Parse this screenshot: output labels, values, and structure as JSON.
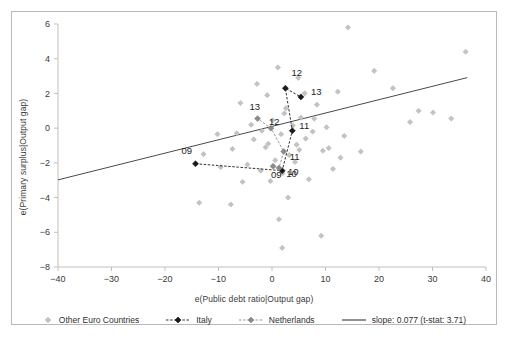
{
  "chart_data": {
    "type": "scatter",
    "title": "",
    "xlabel": "e(Public debt ratio|Output gap)",
    "ylabel": "e(Primary surplus|Output gap)",
    "xlim": [
      -40,
      40
    ],
    "ylim": [
      -8,
      6
    ],
    "xticks": [
      -40,
      -30,
      -20,
      -10,
      0,
      10,
      20,
      30,
      40
    ],
    "yticks": [
      -8,
      -6,
      -4,
      -2,
      0,
      2,
      4,
      6
    ],
    "xtick_labels": [
      "-40",
      "-30",
      "-20",
      "-10",
      "0",
      "10",
      "20",
      "30",
      "40"
    ],
    "ytick_labels": [
      "-8",
      "-6",
      "-4",
      "-2",
      "0",
      "2",
      "4",
      "6"
    ],
    "grid": false,
    "legend_position": "bottom",
    "series": [
      {
        "name": "Other Euro Countries",
        "marker": "diamond",
        "color": "#c3c3c3",
        "points": [
          [
            14.2,
            5.8
          ],
          [
            19.1,
            3.3
          ],
          [
            22.6,
            2.3
          ],
          [
            12.3,
            2.1
          ],
          [
            25.8,
            0.35
          ],
          [
            36.2,
            4.4
          ],
          [
            27.4,
            1.0
          ],
          [
            30.1,
            0.9
          ],
          [
            33.5,
            0.55
          ],
          [
            7.6,
            -0.2
          ],
          [
            10.6,
            -1.15
          ],
          [
            5.1,
            -1.25
          ],
          [
            3.2,
            -1.55
          ],
          [
            9.5,
            -1.3
          ],
          [
            12.8,
            -1.7
          ],
          [
            16.6,
            -1.35
          ],
          [
            -12.8,
            -1.5
          ],
          [
            -7.4,
            -1.2
          ],
          [
            -4.6,
            -2.1
          ],
          [
            -9.6,
            -2.25
          ],
          [
            -2.1,
            -2.45
          ],
          [
            -5.5,
            -3.1
          ],
          [
            -13.6,
            -4.3
          ],
          [
            -7.7,
            -4.4
          ],
          [
            2.0,
            -2.6
          ],
          [
            0.6,
            -1.85
          ],
          [
            -0.7,
            -0.9
          ],
          [
            1.7,
            -0.35
          ],
          [
            3.9,
            0.15
          ],
          [
            5.4,
            0.6
          ],
          [
            2.6,
            1.15
          ],
          [
            0.1,
            0.45
          ],
          [
            -1.9,
            -0.15
          ],
          [
            -3.4,
            -0.65
          ],
          [
            6.3,
            -0.6
          ],
          [
            7.9,
            0.55
          ],
          [
            4.3,
            -1.95
          ],
          [
            -0.3,
            -3.05
          ],
          [
            3.0,
            -4.0
          ],
          [
            6.9,
            -2.95
          ],
          [
            1.3,
            -5.25
          ],
          [
            9.2,
            -6.2
          ],
          [
            -2.8,
            2.55
          ],
          [
            1.1,
            3.5
          ],
          [
            4.9,
            2.9
          ],
          [
            -5.9,
            1.45
          ],
          [
            -0.9,
            1.9
          ],
          [
            6.1,
            2.0
          ],
          [
            8.4,
            1.35
          ],
          [
            2.3,
            0.85
          ],
          [
            -3.9,
            0.2
          ],
          [
            10.2,
            0.05
          ],
          [
            -10.2,
            -0.35
          ],
          [
            -1.2,
            -1.1
          ],
          [
            4.6,
            -0.95
          ],
          [
            11.4,
            -2.35
          ],
          [
            13.5,
            -0.45
          ],
          [
            -6.6,
            -0.3
          ],
          [
            1.9,
            -6.9
          ]
        ]
      },
      {
        "name": "Italy",
        "marker": "diamond-line",
        "color": "#1a1a1a",
        "points": [
          [
            -14.3,
            -2.05
          ],
          [
            1.9,
            -2.45
          ],
          [
            3.8,
            -0.15
          ],
          [
            2.5,
            2.3
          ],
          [
            5.4,
            1.8
          ]
        ],
        "labels": [
          "09",
          "10",
          "11",
          "12",
          "13"
        ],
        "label_offsets": [
          [
            -14,
            -10
          ],
          [
            4,
            6
          ],
          [
            7,
            -2
          ],
          [
            6,
            -12
          ],
          [
            10,
            -2
          ]
        ]
      },
      {
        "name": "Netherlands",
        "marker": "diamond-line",
        "color": "#8a8a8a",
        "points": [
          [
            0.2,
            -2.2
          ],
          [
            1.3,
            -2.3
          ],
          [
            2.2,
            -1.35
          ],
          [
            -0.2,
            0.0
          ],
          [
            -2.7,
            0.55
          ]
        ],
        "labels": [
          "09",
          "10",
          "11",
          "12",
          "13"
        ],
        "label_offsets": [
          [
            -2,
            12
          ],
          [
            9,
            7
          ],
          [
            6,
            8
          ],
          [
            -2,
            -3
          ],
          [
            -8,
            -9
          ]
        ]
      },
      {
        "name": "slope: 0.077 (t-stat: 3.71)",
        "marker": "line",
        "color": "#4a4a4a",
        "fit": {
          "intercept": 0.1,
          "slope": 0.077,
          "x_from": -40,
          "x_to": 36.5
        }
      }
    ]
  },
  "legend": {
    "items": [
      {
        "label": "Other Euro Countries",
        "marker": "diamond",
        "color": "#c3c3c3"
      },
      {
        "label": "Italy",
        "marker": "diamond-line",
        "color": "#1a1a1a"
      },
      {
        "label": "Netherlands",
        "marker": "diamond-line",
        "color": "#8a8a8a"
      },
      {
        "label": "slope: 0.077 (t-stat: 3.71)",
        "marker": "line",
        "color": "#4a4a4a"
      }
    ]
  }
}
